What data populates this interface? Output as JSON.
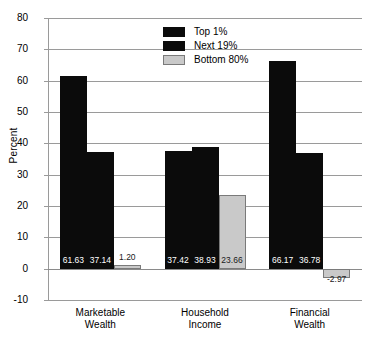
{
  "chart_data": {
    "type": "bar",
    "title": "",
    "xlabel": "",
    "ylabel": "Percent",
    "ylim": [
      -10,
      80
    ],
    "ytick_step": 10,
    "yticks": [
      "80",
      "70",
      "60",
      "50",
      "40",
      "30",
      "20",
      "10",
      "0",
      "-10"
    ],
    "grid": true,
    "legend_position": "top-center",
    "categories": [
      "Marketable Wealth",
      "Household Income",
      "Financial Wealth"
    ],
    "category_lines": [
      [
        "Marketable",
        "Wealth"
      ],
      [
        "Household",
        "Income"
      ],
      [
        "Financial",
        "Wealth"
      ]
    ],
    "series": [
      {
        "name": "Top 1%",
        "color": "#0b0b0b",
        "values": [
          61.63,
          37.42,
          66.17
        ],
        "labels": [
          "61.63",
          "37.42",
          "66.17"
        ]
      },
      {
        "name": "Next 19%",
        "color": "#0b0b0b",
        "values": [
          37.14,
          38.93,
          36.78
        ],
        "labels": [
          "37.14",
          "38.93",
          "36.78"
        ]
      },
      {
        "name": "Bottom 80%",
        "color": "#c9c9c9",
        "values": [
          1.2,
          23.66,
          -2.97
        ],
        "labels": [
          "1.20",
          "23.66",
          "-2.97"
        ]
      }
    ]
  },
  "axis": {
    "y_title": "Percent"
  },
  "legend": {
    "items": [
      {
        "label": "Top 1%",
        "swatch": "dark"
      },
      {
        "label": "Next 19%",
        "swatch": "dark"
      },
      {
        "label": "Bottom 80%",
        "swatch": "light"
      }
    ]
  }
}
